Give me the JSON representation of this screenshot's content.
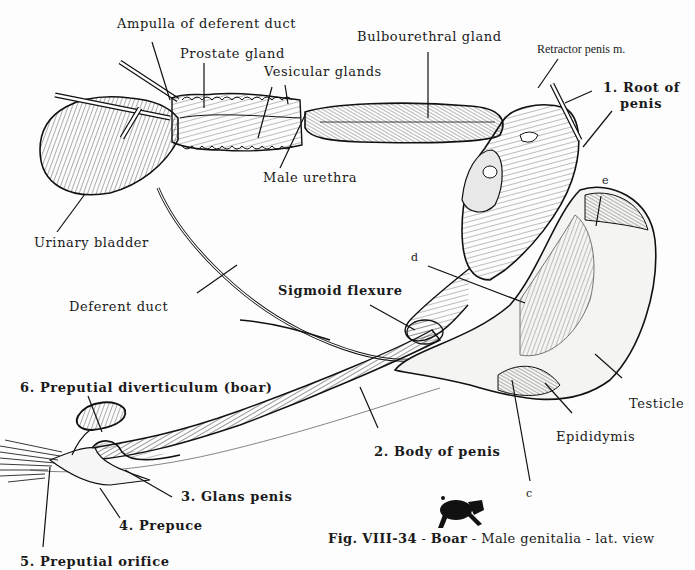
{
  "figure": {
    "caption": {
      "fig_id": "Fig. VIII-34",
      "sep1": " - ",
      "species": "Boar",
      "sep2": " - ",
      "subject": "Male genitalia - lat. view"
    },
    "icon": "boar-silhouette-icon"
  },
  "labels": {
    "ampulla": "Ampulla of deferent duct",
    "prostate": "Prostate gland",
    "vesicular": "Vesicular glands",
    "bulbourethral": "Bulbourethral gland",
    "retractor": "Retractor penis m.",
    "root_1": "1. Root of",
    "root_2": "penis",
    "male_urethra": "Male urethra",
    "urinary_bladder": "Urinary bladder",
    "deferent_duct": "Deferent duct",
    "sigmoid": "Sigmoid flexure",
    "d": "d",
    "e": "e",
    "c": "c",
    "testicle": "Testicle",
    "epididymis": "Epididymis",
    "body": "2. Body of penis",
    "glans": "3. Glans penis",
    "prepuce": "4. Prepuce",
    "orifice": "5. Preputial orifice",
    "diverticulum": "6. Preputial diverticulum (boar)"
  },
  "colors": {
    "ink": "#1a1a1a",
    "paper": "#fdfdfd",
    "tissue": "#f4f4f2"
  }
}
